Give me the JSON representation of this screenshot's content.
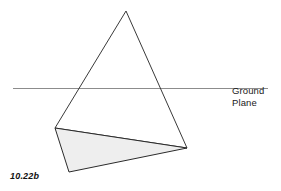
{
  "figure": {
    "caption": "10.22b",
    "background_color": "#ffffff"
  },
  "labels": {
    "ground_plane_line1": "Ground",
    "ground_plane_line2": "Plane"
  },
  "chart_data": {
    "type": "diagram",
    "title": "10.22b",
    "annotations": [
      "Ground Plane",
      "10.22b"
    ],
    "colors": {
      "outline": "#3a3a3a",
      "shaded_fill": "#eeeeee",
      "shaded_outline": "#2b2b2b",
      "ground_line": "#8c8c8c",
      "background": "#ffffff",
      "text": "#1a1a1a"
    },
    "shapes": [
      {
        "name": "main-triangle",
        "type": "polygon",
        "fill": "none",
        "stroke": "#3a3a3a",
        "stroke_width": 1,
        "points": [
          [
            126,
            11
          ],
          [
            187,
            148
          ],
          [
            55,
            128
          ]
        ]
      },
      {
        "name": "shaded-triangle",
        "type": "polygon",
        "fill": "#eeeeee",
        "stroke": "#2b2b2b",
        "stroke_width": 1,
        "points": [
          [
            55,
            128
          ],
          [
            187,
            148
          ],
          [
            69,
            172
          ]
        ]
      },
      {
        "name": "ground-plane-line",
        "type": "line",
        "stroke": "#8c8c8c",
        "stroke_width": 1,
        "x1": 13,
        "y1": 88,
        "x2": 268,
        "y2": 88
      }
    ]
  }
}
